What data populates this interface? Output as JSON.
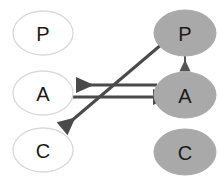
{
  "diagram": {
    "background_color": "#ffffff",
    "columns": {
      "left": {
        "name": "unshaded-column",
        "fill_color": "#ffffff",
        "stroke_color": "#d4d4d4"
      },
      "right": {
        "name": "shaded-column",
        "fill_color": "#a9a9a9",
        "stroke_color": "#a9a9a9"
      }
    },
    "nodes": [
      {
        "id": "left-p",
        "label": "P",
        "column": "left",
        "cx": 43,
        "cy": 33,
        "rx": 30,
        "ry": 22,
        "fill": "#ffffff",
        "stroke": "#d4d4d4",
        "text_color": "#1a1a1a"
      },
      {
        "id": "left-a",
        "label": "A",
        "column": "left",
        "cx": 43,
        "cy": 93,
        "rx": 30,
        "ry": 22,
        "fill": "#ffffff",
        "stroke": "#d4d4d4",
        "text_color": "#1a1a1a"
      },
      {
        "id": "left-c",
        "label": "C",
        "column": "left",
        "cx": 43,
        "cy": 150,
        "rx": 30,
        "ry": 22,
        "fill": "#ffffff",
        "stroke": "#d4d4d4",
        "text_color": "#1a1a1a"
      },
      {
        "id": "right-p",
        "label": "P",
        "column": "right",
        "cx": 185,
        "cy": 33,
        "rx": 31,
        "ry": 23,
        "fill": "#a9a9a9",
        "stroke": "#a9a9a9",
        "text_color": "#1a1a1a"
      },
      {
        "id": "right-a",
        "label": "A",
        "column": "right",
        "cx": 185,
        "cy": 95,
        "rx": 31,
        "ry": 23,
        "fill": "#a9a9a9",
        "stroke": "#a9a9a9",
        "text_color": "#1a1a1a"
      },
      {
        "id": "right-c",
        "label": "C",
        "column": "right",
        "cx": 185,
        "cy": 152,
        "rx": 31,
        "ry": 23,
        "fill": "#a9a9a9",
        "stroke": "#a9a9a9",
        "text_color": "#1a1a1a"
      }
    ],
    "edges": [
      {
        "id": "right-p-to-right-a",
        "name": "arrow-right-p-to-right-a",
        "from": "right-p",
        "to": "right-a",
        "direction": "down",
        "color": "#555555",
        "width": 2,
        "x1": 185,
        "y1": 56,
        "x2": 185,
        "y2": 71
      },
      {
        "id": "right-a-to-left-a",
        "name": "arrow-right-a-to-left-a",
        "from": "right-a",
        "to": "left-a",
        "direction": "left",
        "color": "#4a4a4a",
        "width": 3,
        "x1": 157,
        "y1": 85,
        "x2": 74,
        "y2": 85
      },
      {
        "id": "left-a-to-right-a",
        "name": "arrow-left-a-to-right-a",
        "from": "left-a",
        "to": "right-a",
        "direction": "right",
        "color": "#4a4a4a",
        "width": 3,
        "x1": 72,
        "y1": 97,
        "x2": 155,
        "y2": 97
      },
      {
        "id": "right-p-to-left-c",
        "name": "arrow-right-p-to-left-c",
        "from": "right-p",
        "to": "left-c",
        "direction": "diagonal-down-left",
        "color": "#4a4a4a",
        "width": 3,
        "x1": 162,
        "y1": 44,
        "x2": 60,
        "y2": 131
      }
    ]
  }
}
